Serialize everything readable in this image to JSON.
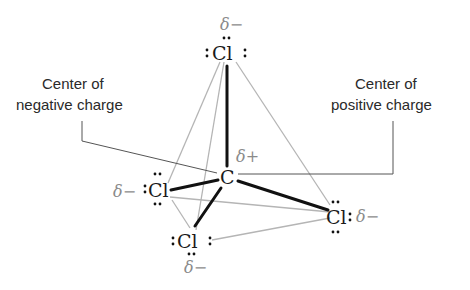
{
  "labels": {
    "negative_center": [
      "Center of",
      "negative charge"
    ],
    "positive_center": [
      "Center of",
      "positive charge"
    ]
  },
  "atoms": {
    "central": "C",
    "top": "Cl",
    "left": "Cl",
    "bottom": "Cl",
    "right": "Cl"
  },
  "partial_charges": {
    "central": "δ+",
    "top": "δ−",
    "left": "δ−",
    "bottom": "δ−",
    "right": "δ−"
  },
  "colors": {
    "bond": "#111111",
    "edge": "#b5b5b5",
    "delta": "#8a8a8a",
    "text": "#2a2a2a"
  }
}
